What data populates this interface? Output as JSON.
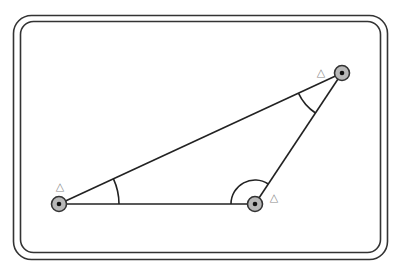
{
  "diagram": {
    "type": "triangle-with-angle-markers",
    "frame": {
      "outer": {
        "x": 13.5,
        "y": 15.5,
        "w": 374,
        "h": 244,
        "r": 18
      },
      "inner": {
        "x": 20.5,
        "y": 21.5,
        "w": 360,
        "h": 231,
        "r": 13
      },
      "stroke": "#333333"
    },
    "vertices": [
      {
        "id": "A",
        "x": 59,
        "y": 204,
        "label": "△",
        "label_x": 60,
        "label_y": 190
      },
      {
        "id": "B",
        "x": 255,
        "y": 204,
        "label": "△",
        "label_x": 274,
        "label_y": 201
      },
      {
        "id": "C",
        "x": 342,
        "y": 73,
        "label": "△",
        "label_x": 321,
        "label_y": 76
      }
    ],
    "edges": [
      [
        "A",
        "B"
      ],
      [
        "B",
        "C"
      ],
      [
        "C",
        "A"
      ]
    ],
    "angle_arcs": [
      {
        "vertex": "A",
        "radius": 60
      },
      {
        "vertex": "B",
        "radius": 24
      },
      {
        "vertex": "C",
        "radius": 48
      }
    ],
    "colors": {
      "line": "#222222",
      "vertex_fill": "#b8b8b8",
      "vertex_ring": "#333333",
      "vertex_dot": "#111111",
      "label": "#888888"
    }
  }
}
